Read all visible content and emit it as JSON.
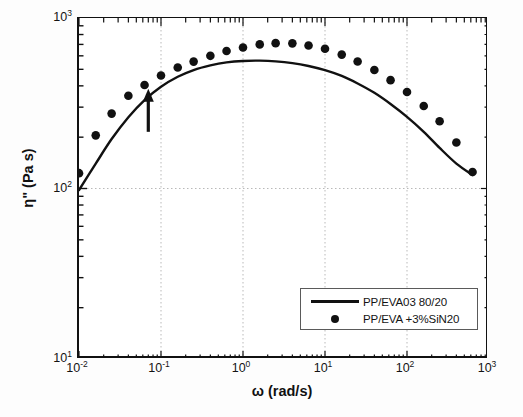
{
  "chart_data": {
    "type": "line",
    "title": "",
    "xlabel": "ω (rad/s)",
    "ylabel": "η\" (Pa s)",
    "xscale": "log",
    "yscale": "log",
    "xlim": [
      0.01,
      1000
    ],
    "ylim": [
      10,
      1000
    ],
    "grid": true,
    "grid_style": "dotted",
    "legend_position": "lower-right",
    "x_ticks": [
      "10⁻²",
      "10⁻¹",
      "10⁰",
      "10¹",
      "10²",
      "10³"
    ],
    "x_tick_values": [
      0.01,
      0.1,
      1,
      10,
      100,
      1000
    ],
    "y_ticks": [
      "10¹",
      "10²",
      "10³"
    ],
    "y_tick_values": [
      10,
      100,
      1000
    ],
    "series": [
      {
        "name": "PP/EVA03 80/20",
        "style": "solid-line",
        "color": "#111111",
        "x": [
          0.01,
          0.016,
          0.025,
          0.04,
          0.063,
          0.1,
          0.16,
          0.25,
          0.4,
          0.63,
          1.0,
          1.6,
          2.5,
          4.0,
          6.3,
          10,
          16,
          25,
          40,
          63,
          100,
          160,
          250,
          400,
          630
        ],
        "y": [
          98,
          140,
          195,
          262,
          330,
          395,
          452,
          495,
          527,
          549,
          560,
          562,
          557,
          544,
          523,
          494,
          457,
          413,
          364,
          313,
          263,
          215,
          173,
          140,
          120
        ]
      },
      {
        "name": "PP/EVA +3%SiN20",
        "style": "filled-circles",
        "color": "#111111",
        "x": [
          0.01,
          0.016,
          0.025,
          0.04,
          0.063,
          0.1,
          0.16,
          0.25,
          0.4,
          0.63,
          1.0,
          1.6,
          2.5,
          4.0,
          6.3,
          10,
          16,
          25,
          40,
          63,
          100,
          160,
          250,
          400,
          630
        ],
        "y": [
          123,
          205,
          275,
          350,
          405,
          460,
          512,
          555,
          600,
          640,
          672,
          700,
          712,
          710,
          690,
          660,
          610,
          556,
          495,
          432,
          368,
          305,
          248,
          186,
          125
        ]
      }
    ],
    "annotations": [
      {
        "type": "arrow",
        "direction": "up",
        "x": 0.07,
        "y_start": 215,
        "y_end": 385,
        "color": "#111111"
      }
    ]
  },
  "axes": {
    "x_title": "ω (rad/s)",
    "y_title_symbol": "η\"",
    "y_title_units": "(Pa s)",
    "x_tick_labels": [
      {
        "base": "10",
        "exp": "-2"
      },
      {
        "base": "10",
        "exp": "-1"
      },
      {
        "base": "10",
        "exp": "0"
      },
      {
        "base": "10",
        "exp": "1"
      },
      {
        "base": "10",
        "exp": "2"
      },
      {
        "base": "10",
        "exp": "3"
      }
    ],
    "y_tick_labels": [
      {
        "base": "10",
        "exp": "3"
      },
      {
        "base": "10",
        "exp": "2"
      },
      {
        "base": "10",
        "exp": "1"
      }
    ]
  },
  "legend": {
    "entries": [
      {
        "label": "PP/EVA03 80/20",
        "marker": "line"
      },
      {
        "label": "PP/EVA +3%SiN20",
        "marker": "dot"
      }
    ]
  }
}
